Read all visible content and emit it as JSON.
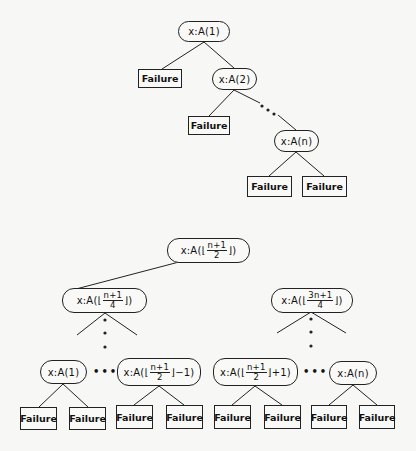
{
  "diagram": {
    "tree1": {
      "nodes": [
        {
          "id": "t1-root",
          "label": "x:A(1)",
          "x": 178,
          "y": 21,
          "w": 52,
          "h": 21
        },
        {
          "id": "t1-a2",
          "label": "x:A(2)",
          "x": 212,
          "y": 68,
          "w": 45,
          "h": 22
        },
        {
          "id": "t1-an",
          "label": "x:A(n)",
          "x": 274,
          "y": 130,
          "w": 45,
          "h": 22
        }
      ],
      "leaves": [
        {
          "id": "t1-f1",
          "label": "Failure",
          "x": 138,
          "y": 69,
          "w": 44,
          "h": 19
        },
        {
          "id": "t1-f2",
          "label": "Failure",
          "x": 188,
          "y": 116,
          "w": 42,
          "h": 19
        },
        {
          "id": "t1-f3",
          "label": "Failure",
          "x": 247,
          "y": 176,
          "w": 45,
          "h": 21
        },
        {
          "id": "t1-f4",
          "label": "Failure",
          "x": 302,
          "y": 176,
          "w": 45,
          "h": 21
        }
      ],
      "edges": [
        [
          204,
          42,
          162,
          69
        ],
        [
          204,
          42,
          234,
          68
        ],
        [
          234,
          90,
          209,
          116
        ],
        [
          234,
          90,
          260,
          103
        ],
        [
          278,
          115,
          296,
          130
        ],
        [
          296,
          152,
          269,
          176
        ],
        [
          296,
          152,
          324,
          176
        ]
      ],
      "ellipsis_dots": [
        [
          262,
          106
        ],
        [
          268,
          110
        ],
        [
          274,
          114
        ]
      ]
    },
    "tree2": {
      "root": {
        "id": "t2-root",
        "prefix": "x:A(⌊",
        "num": "n+1",
        "den": "2",
        "suffix": "⌋)",
        "x": 167,
        "y": 238,
        "w": 83,
        "h": 25
      },
      "mid_nodes": [
        {
          "id": "t2-left",
          "prefix": "x:A(⌊",
          "num": "n+1",
          "den": "4",
          "suffix": "⌋)",
          "x": 62,
          "y": 288,
          "w": 85,
          "h": 25
        },
        {
          "id": "t2-right",
          "prefix": "x:A(⌊",
          "num": "3n+1",
          "den": "4",
          "suffix": "⌋)",
          "x": 271,
          "y": 288,
          "w": 82,
          "h": 25
        }
      ],
      "bottom_nodes": [
        {
          "id": "t2-b1",
          "simple": "x:A(1)",
          "x": 40,
          "y": 360,
          "w": 47,
          "h": 24
        },
        {
          "id": "t2-b2",
          "prefix": "x:A(⌊",
          "num": "n+1",
          "den": "2",
          "suffix": "⌋−1)",
          "x": 117,
          "y": 358,
          "w": 84,
          "h": 28
        },
        {
          "id": "t2-b3",
          "prefix": "x:A(⌊",
          "num": "n+1",
          "den": "2",
          "suffix": "⌋+1)",
          "x": 213,
          "y": 358,
          "w": 85,
          "h": 28
        },
        {
          "id": "t2-b4",
          "simple": "x:A(n)",
          "x": 329,
          "y": 361,
          "w": 48,
          "h": 24
        }
      ],
      "leaves": [
        {
          "id": "t2-f1",
          "label": "Failure",
          "x": 20,
          "y": 407,
          "w": 37,
          "h": 23
        },
        {
          "id": "t2-f2",
          "label": "Failure",
          "x": 69,
          "y": 407,
          "w": 37,
          "h": 23
        },
        {
          "id": "t2-f3",
          "label": "Failure",
          "x": 116,
          "y": 405,
          "w": 37,
          "h": 24
        },
        {
          "id": "t2-f4",
          "label": "Failure",
          "x": 166,
          "y": 405,
          "w": 37,
          "h": 24
        },
        {
          "id": "t2-f5",
          "label": "Failure",
          "x": 214,
          "y": 405,
          "w": 37,
          "h": 24
        },
        {
          "id": "t2-f6",
          "label": "Failure",
          "x": 264,
          "y": 405,
          "w": 37,
          "h": 24
        },
        {
          "id": "t2-f7",
          "label": "Failure",
          "x": 311,
          "y": 405,
          "w": 36,
          "h": 24
        },
        {
          "id": "t2-f8",
          "label": "Failure",
          "x": 359,
          "y": 405,
          "w": 36,
          "h": 24
        }
      ],
      "edges": [
        [
          179,
          262,
          76,
          289
        ],
        [
          105,
          313,
          77,
          335
        ],
        [
          105,
          313,
          137,
          335
        ],
        [
          311,
          312,
          277,
          333
        ],
        [
          311,
          312,
          346,
          333
        ],
        [
          63,
          384,
          39,
          407
        ],
        [
          63,
          384,
          88,
          407
        ],
        [
          159,
          386,
          134,
          405
        ],
        [
          159,
          386,
          184,
          405
        ],
        [
          255,
          386,
          232,
          405
        ],
        [
          255,
          386,
          282,
          405
        ],
        [
          353,
          385,
          329,
          405
        ],
        [
          353,
          385,
          377,
          405
        ]
      ],
      "vertical_dots": [
        [
          105,
          320
        ],
        [
          105,
          333
        ],
        [
          105,
          347
        ],
        [
          311,
          319
        ],
        [
          311,
          332
        ],
        [
          311,
          346
        ]
      ],
      "horizontal_ellipses": [
        {
          "label": "•••",
          "x": 93,
          "y": 366
        },
        {
          "label": "•••",
          "x": 303,
          "y": 366
        }
      ]
    }
  },
  "colors": {
    "ink": "#222222",
    "paper": "#f7f7f5",
    "bleed_text": "#e6e6e2"
  }
}
